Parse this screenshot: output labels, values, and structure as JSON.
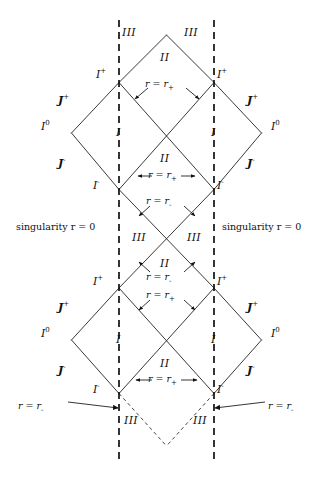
{
  "figure": {
    "type": "penrose-conformal-diagram",
    "name": "Reissner-Nordstrom maximal extension",
    "width": 333,
    "height": 478,
    "background": "#ffffff",
    "line_color": "#222222",
    "text_color": "#111111"
  },
  "geometry": {
    "center_x": 166.5,
    "half_width": 47.5,
    "levels": {
      "top_apex": 35,
      "scri_plus_upper": 81,
      "spatial_infinity_upper": 133,
      "scri_minus_upper": 190,
      "cross_middle": 238,
      "scri_plus_lower": 288,
      "spatial_infinity_lower": 340,
      "scri_minus_lower": 394,
      "bottom_vertex": 446
    },
    "singularity_x_left": 119,
    "singularity_x_right": 214,
    "singularity_y_top": 20,
    "singularity_y_bottom": 462
  },
  "regions": [
    {
      "id": "r-II-top",
      "label": "II",
      "x": 166,
      "y": 57
    },
    {
      "id": "r-III-top-left",
      "label": "III",
      "x": 127,
      "y": 34
    },
    {
      "id": "r-III-top-right",
      "label": "III",
      "x": 192,
      "y": 34
    },
    {
      "id": "r-I-upper-left",
      "label": "I",
      "x": 119,
      "y": 133
    },
    {
      "id": "r-I-upper-right",
      "label": "I",
      "x": 214,
      "y": 133
    },
    {
      "id": "r-II-upper-mid",
      "label": "II",
      "x": 166,
      "y": 158
    },
    {
      "id": "r-III-mid-left",
      "label": "III",
      "x": 140,
      "y": 238
    },
    {
      "id": "r-III-mid-right",
      "label": "III",
      "x": 194,
      "y": 238
    },
    {
      "id": "r-II-mid-lower",
      "label": "II",
      "x": 166,
      "y": 263
    },
    {
      "id": "r-I-lower-left",
      "label": "I",
      "x": 119,
      "y": 340
    },
    {
      "id": "r-I-lower-right",
      "label": "I",
      "x": 214,
      "y": 340
    },
    {
      "id": "r-II-bottom",
      "label": "II",
      "x": 166,
      "y": 364
    },
    {
      "id": "r-III-bot-left",
      "label": "III",
      "x": 131,
      "y": 421
    },
    {
      "id": "r-III-bot-right",
      "label": "III",
      "x": 201,
      "y": 421
    }
  ],
  "infinities": [
    {
      "id": "i-plus-upper-left",
      "symbol": "I",
      "script": "+",
      "x": 103,
      "y": 74
    },
    {
      "id": "i-plus-upper-right",
      "symbol": "I",
      "script": "+",
      "x": 222,
      "y": 74
    },
    {
      "id": "scri-plus-upper-left",
      "symbol": "J",
      "script": "+",
      "x": 66,
      "y": 100
    },
    {
      "id": "scri-plus-upper-right",
      "symbol": "J",
      "script": "+",
      "x": 253,
      "y": 100
    },
    {
      "id": "i-zero-upper-left",
      "symbol": "I",
      "script": "0",
      "x": 49,
      "y": 126
    },
    {
      "id": "i-zero-upper-right",
      "symbol": "I",
      "script": "0",
      "x": 277,
      "y": 126
    },
    {
      "id": "scri-minus-upper-left",
      "symbol": "J",
      "script": "-",
      "x": 66,
      "y": 163
    },
    {
      "id": "scri-minus-upper-right",
      "symbol": "J",
      "script": "-",
      "x": 253,
      "y": 163
    },
    {
      "id": "i-minus-upper-left",
      "symbol": "I",
      "script": "-",
      "x": 100,
      "y": 185
    },
    {
      "id": "i-minus-upper-right",
      "symbol": "I",
      "script": "-",
      "x": 222,
      "y": 185
    },
    {
      "id": "i-plus-lower-left",
      "symbol": "I",
      "script": "+",
      "x": 100,
      "y": 281
    },
    {
      "id": "i-plus-lower-right",
      "symbol": "I",
      "script": "+",
      "x": 222,
      "y": 281
    },
    {
      "id": "scri-plus-lower-left",
      "symbol": "J",
      "script": "+",
      "x": 66,
      "y": 307
    },
    {
      "id": "scri-plus-lower-right",
      "symbol": "J",
      "script": "+",
      "x": 253,
      "y": 307
    },
    {
      "id": "i-zero-lower-left",
      "symbol": "I",
      "script": "0",
      "x": 49,
      "y": 333
    },
    {
      "id": "i-zero-lower-right",
      "symbol": "I",
      "script": "0",
      "x": 277,
      "y": 333
    },
    {
      "id": "scri-minus-lower-left",
      "symbol": "J",
      "script": "-",
      "x": 66,
      "y": 370
    },
    {
      "id": "scri-minus-lower-right",
      "symbol": "J",
      "script": "-",
      "x": 253,
      "y": 370
    },
    {
      "id": "i-minus-lower-left",
      "symbol": "I",
      "script": "-",
      "x": 100,
      "y": 389
    },
    {
      "id": "i-minus-lower-right",
      "symbol": "I",
      "script": "-",
      "x": 222,
      "y": 389
    }
  ],
  "horizon_labels": [
    {
      "id": "h-rplus-top",
      "text": "r = r",
      "sub": "+",
      "x": 166,
      "y": 85
    },
    {
      "id": "h-rplus-mid",
      "text": "r = r",
      "sub": "+",
      "x": 166,
      "y": 176
    },
    {
      "id": "h-rminus-upper",
      "text": "r = r",
      "sub": "-",
      "x": 166,
      "y": 202
    },
    {
      "id": "h-rminus-lower",
      "text": "r = r",
      "sub": "-",
      "x": 166,
      "y": 278
    },
    {
      "id": "h-rplus-lower",
      "text": "r = r",
      "sub": "+",
      "x": 166,
      "y": 296
    },
    {
      "id": "h-rplus-bottom",
      "text": "r = r",
      "sub": "+",
      "x": 166,
      "y": 380
    },
    {
      "id": "h-rminus-bot-left",
      "text": "r = r",
      "sub": "-",
      "x": 42,
      "y": 407
    },
    {
      "id": "h-rminus-bot-right",
      "text": "r = r",
      "sub": "-",
      "x": 291,
      "y": 407
    }
  ],
  "singularity_labels": [
    {
      "id": "sing-left",
      "text": "singularity r = 0",
      "x": 62,
      "y": 228
    },
    {
      "id": "sing-right",
      "text": "singularity r = 0",
      "x": 272,
      "y": 228
    }
  ]
}
